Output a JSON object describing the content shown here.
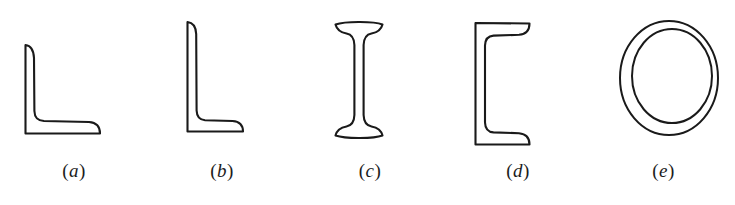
{
  "figure": {
    "background_color": "#ffffff",
    "ink_color": "#1a1a1a",
    "width": 735,
    "height": 205,
    "caption_open_paren": "(",
    "caption_close_paren": ")"
  },
  "sections": [
    {
      "key": "a",
      "label": "a",
      "name": "equal-leg-angle",
      "left": 0,
      "width": 148,
      "caption_top": 160,
      "art_left": 22,
      "art_top": 42,
      "art_width": 82,
      "art_height": 96,
      "stroke_width": 2.1,
      "path": "M 3.5 3 L 3.5 91.5 L 78 91.5 C 78 85 74.5 80.5 67 80 L 22 79 C 15 78.6 12.6 75.5 12.4 69 L 12 16 C 11.6 8 9 3.6 3.5 3 Z"
    },
    {
      "key": "b",
      "label": "b",
      "name": "unequal-leg-angle",
      "left": 148,
      "width": 148,
      "caption_top": 160,
      "art_left": 36,
      "art_top": 19,
      "art_width": 64,
      "art_height": 117,
      "stroke_width": 2.1,
      "path": "M 3.5 3 L 3.5 112.5 L 59 112.5 C 59 106.5 55.5 102.5 48.5 102 L 21 101.2 C 15 100.8 12.8 97.6 12.6 91.5 L 12.2 15 C 11.9 8 9.2 3.6 3.5 3 Z"
    },
    {
      "key": "c",
      "label": "c",
      "name": "i-beam-wide-flange",
      "left": 296,
      "width": 148,
      "caption_top": 160,
      "art_left": 36,
      "art_top": 20,
      "art_width": 56,
      "art_height": 124,
      "stroke_width": 2.1,
      "path": "M 3.5 4.5 C 9 2.6 18 2 26.5 2 L 28 2 C 37 2 45.5 2.6 50.5 4.5 C 49 10.5 45 12.5 39.5 13.5 C 33.5 14.6 31.8 18.5 31.6 25 L 31.6 95 C 31.8 101.5 33.5 105.4 39.5 106.5 C 45 107.5 49 109.5 50.5 115.5 C 45.5 117.4 37 118 28 118 L 26.5 118 C 18 118 9 117.4 3.5 115.5 C 5 109.5 9 107.5 14.5 106.5 C 20.5 105.4 22.2 101.5 22.4 95 L 22.4 25 C 22.2 18.5 20.5 14.6 14.5 13.5 C 9 12.5 5 10.5 3.5 4.5 Z"
    },
    {
      "key": "d",
      "label": "d",
      "name": "channel-section",
      "left": 444,
      "width": 148,
      "caption_top": 160,
      "art_left": 28,
      "art_top": 20,
      "art_width": 62,
      "art_height": 128,
      "stroke_width": 2.1,
      "path": "M 3.5 3 L 3.5 124.5 L 57.5 124.5 C 57.5 118 54 113.8 47 113.2 L 21.5 112.4 C 15.5 112 13.2 108.8 13 102.5 L 13 25.5 C 13.2 19.2 15.5 16 21.5 15.6 L 47 14.8 C 54 14.2 57.5 10 57.5 3.5 Z"
    },
    {
      "key": "e",
      "label": "e",
      "name": "circular-hollow-tube",
      "left": 592,
      "width": 143,
      "caption_top": 160,
      "art_left": 25,
      "art_top": 18,
      "art_width": 104,
      "art_height": 124,
      "stroke_width": 2.0,
      "outer_cx": 52,
      "outer_cy": 60,
      "outer_rx": 49,
      "outer_ry": 57,
      "inner_cx": 55,
      "inner_cy": 58,
      "inner_rx": 40,
      "inner_ry": 47
    }
  ]
}
